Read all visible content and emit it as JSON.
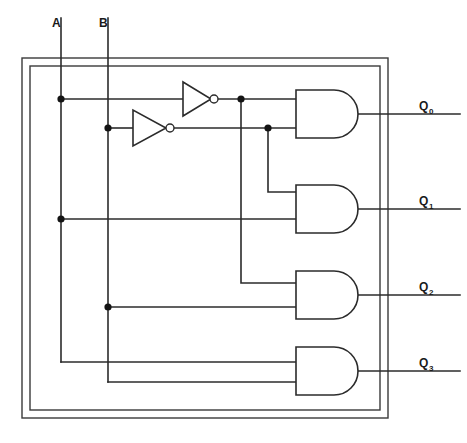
{
  "diagram": {
    "type": "logic-circuit",
    "stroke_color": "#2b2b2b",
    "background_color": "#ffffff",
    "inputs": [
      {
        "id": "A",
        "label": "A",
        "label_x": 52,
        "label_y": 27,
        "line_x": 61,
        "line_top": 18,
        "line_bottom": 362
      },
      {
        "id": "B",
        "label": "B",
        "label_x": 99,
        "label_y": 27,
        "line_x": 108,
        "line_top": 18,
        "line_bottom": 382
      }
    ],
    "outputs": [
      {
        "id": "Q0",
        "label": "Q",
        "subscript": "0",
        "label_x": 419,
        "label_y": 110,
        "wire_y": 114,
        "wire_x1": 358,
        "wire_x2": 460
      },
      {
        "id": "Q1",
        "label": "Q",
        "subscript": "1",
        "label_x": 419,
        "label_y": 205,
        "wire_y": 209,
        "wire_x1": 358,
        "wire_x2": 460
      },
      {
        "id": "Q2",
        "label": "Q",
        "subscript": "2",
        "label_x": 419,
        "label_y": 291,
        "wire_y": 295,
        "wire_x1": 358,
        "wire_x2": 460
      },
      {
        "id": "Q3",
        "label": "Q",
        "subscript": "3",
        "label_x": 419,
        "label_y": 367,
        "wire_y": 371,
        "wire_x1": 358,
        "wire_x2": 460
      }
    ],
    "inverters": [
      {
        "id": "inv-A",
        "signal_out": "A-not",
        "x": 183,
        "y_center": 99,
        "width": 28,
        "height": 34,
        "bubble_cx": 214,
        "bubble_r": 4
      },
      {
        "id": "inv-B",
        "signal_out": "B-not",
        "x": 133,
        "y_center": 128,
        "width": 33,
        "height": 35,
        "bubble_cx": 170,
        "bubble_r": 4
      }
    ],
    "and_gates": [
      {
        "id": "and-q0",
        "x": 296,
        "y": 90,
        "width": 62,
        "height": 48,
        "input_top_y": 99,
        "input_bottom_y": 128,
        "output_y": 114,
        "inputs": [
          "A-not",
          "B-not"
        ]
      },
      {
        "id": "and-q1",
        "x": 296,
        "y": 185,
        "width": 62,
        "height": 48,
        "input_top_y": 192,
        "input_bottom_y": 219,
        "output_y": 209,
        "inputs": [
          "B-not",
          "A"
        ]
      },
      {
        "id": "and-q2",
        "x": 296,
        "y": 271,
        "width": 62,
        "height": 48,
        "input_top_y": 283,
        "input_bottom_y": 307,
        "output_y": 295,
        "inputs": [
          "A-not",
          "B"
        ]
      },
      {
        "id": "and-q3",
        "x": 296,
        "y": 347,
        "width": 62,
        "height": 48,
        "input_top_y": 362,
        "input_bottom_y": 382,
        "output_y": 371,
        "inputs": [
          "A",
          "B"
        ]
      }
    ],
    "junction_dots": [
      {
        "id": "dot-a-top",
        "x": 61,
        "y": 99,
        "signal": "A"
      },
      {
        "id": "dot-a-mid",
        "x": 61,
        "y": 219,
        "signal": "A"
      },
      {
        "id": "dot-b-top",
        "x": 108,
        "y": 128,
        "signal": "B"
      },
      {
        "id": "dot-b-mid",
        "x": 108,
        "y": 307,
        "signal": "B"
      },
      {
        "id": "dot-anot",
        "x": 241,
        "y": 99,
        "signal": "A-not"
      },
      {
        "id": "dot-bnot",
        "x": 268,
        "y": 128,
        "signal": "B-not"
      }
    ],
    "border": {
      "outer": {
        "x": 22,
        "y": 58,
        "width": 366,
        "height": 360
      },
      "inner": {
        "x": 30,
        "y": 66,
        "width": 350,
        "height": 344
      }
    }
  }
}
